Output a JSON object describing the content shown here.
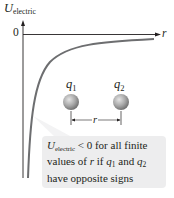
{
  "diagram": {
    "y_axis": {
      "symbol": "U",
      "subscript": "electric"
    },
    "x_axis": {
      "symbol": "r"
    },
    "origin_label": "0",
    "curve": {
      "description": "Electric potential energy vs separation r for opposite charges; negative, approaching 0 from below as r increases",
      "color": "#6d6e70"
    },
    "charges": [
      {
        "symbol": "q",
        "subscript": "1"
      },
      {
        "symbol": "q",
        "subscript": "2"
      }
    ],
    "separation_label": "r",
    "callout": {
      "line1_symbol": "U",
      "line1_subscript": "electric",
      "line1_rest": " < 0 for all finite",
      "line2_pre": "values of ",
      "line2_r": "r",
      "line2_mid": " if ",
      "line2_q1": "q",
      "line2_q1_sub": "1",
      "line2_and": " and ",
      "line2_q2": "q",
      "line2_q2_sub": "2",
      "line3": "have opposite signs",
      "background": "#ededee"
    }
  }
}
